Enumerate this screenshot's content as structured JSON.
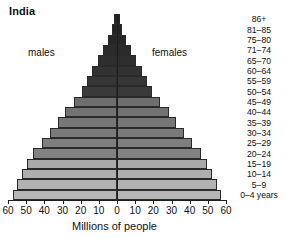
{
  "chart": {
    "title": "India",
    "xlabel": "Millions of people",
    "annotation_males": "males",
    "annotation_females": "females"
  },
  "chart_data": {
    "type": "bar",
    "orientation": "horizontal-pyramid",
    "title": "India",
    "xlabel": "Millions of people",
    "ylabel": "",
    "grid": false,
    "legend_position": "inline-annotations",
    "xlim": [
      -60,
      60
    ],
    "xticks": [
      60,
      50,
      40,
      30,
      20,
      10,
      0,
      10,
      20,
      30,
      40,
      50,
      60
    ],
    "xtick_labels": [
      "60",
      "50",
      "40",
      "30",
      "20",
      "10",
      "0",
      "10",
      "20",
      "30",
      "40",
      "50",
      "60"
    ],
    "categories": [
      "86+",
      "81–85",
      "75–80",
      "71–74",
      "65–70",
      "60–64",
      "55–59",
      "50–54",
      "45–49",
      "40–44",
      "35–39",
      "30–34",
      "25–29",
      "20–24",
      "15–19",
      "10–14",
      "5–9",
      "0–4 years"
    ],
    "series": [
      {
        "name": "males",
        "side": "left",
        "values": [
          1.6,
          3.0,
          5.0,
          7.5,
          10.5,
          13.5,
          16.5,
          19.5,
          23.5,
          28.5,
          32.5,
          37.0,
          41.5,
          46.0,
          49.5,
          52.5,
          55.0,
          57.0
        ]
      },
      {
        "name": "females",
        "side": "right",
        "values": [
          1.6,
          3.0,
          5.0,
          7.5,
          10.5,
          13.5,
          16.5,
          19.5,
          23.5,
          28.5,
          32.5,
          37.0,
          41.5,
          46.0,
          49.5,
          52.5,
          55.0,
          57.0
        ]
      }
    ],
    "bar_colors": [
      "#1f1f1f",
      "#232323",
      "#262626",
      "#2a2a2a",
      "#2e2e2e",
      "#323232",
      "#363636",
      "#3a3a3a",
      "#6e6e6e",
      "#727272",
      "#767676",
      "#7a7a7a",
      "#7e7e7e",
      "#828282",
      "#a9a9a9",
      "#aeaeae",
      "#b2b2b2",
      "#b6b6b6"
    ]
  },
  "colors": {
    "axis": "#1d1d1d",
    "text": "#111111",
    "background": "#ffffff"
  }
}
